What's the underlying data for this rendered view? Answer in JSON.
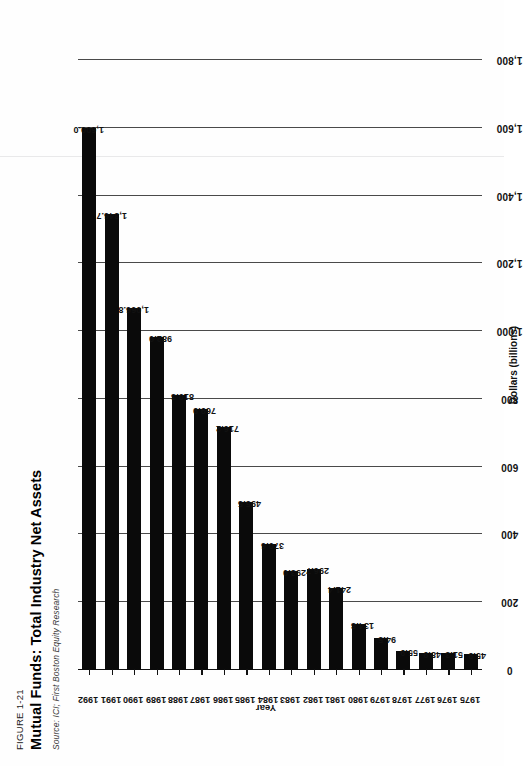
{
  "figure": {
    "number": "FIGURE 1-21",
    "title": "Mutual Funds: Total Industry Net Assets",
    "source": "Source: ICI; First Boston Equity Research"
  },
  "chart_data": {
    "type": "bar",
    "orientation": "horizontal",
    "title": "Mutual Funds: Total Industry Net Assets",
    "xlabel": "Year",
    "ylabel": "Dollars (billions)",
    "ylim": [
      0,
      1800
    ],
    "grid": true,
    "legend": "none",
    "categories": [
      "1975",
      "1976",
      "1977",
      "1978",
      "1979",
      "1980",
      "1981",
      "1982",
      "1983",
      "1984",
      "1985",
      "1986",
      "1987",
      "1988",
      "1989",
      "1990",
      "1991",
      "1992"
    ],
    "values": [
      45.9,
      51.3,
      48.9,
      55.9,
      94.5,
      134.8,
      241.4,
      296.7,
      293.0,
      370.6,
      495.5,
      716.2,
      769.9,
      810.3,
      982.0,
      1066.8,
      1346.7,
      1600.0
    ],
    "data_labels": [
      "45.9",
      "51.3",
      "48.9",
      "55.9",
      "94.5",
      "134.8",
      "241.4",
      "296.7",
      "293.0",
      "370.6",
      "495.5",
      "716.2",
      "769.9",
      "810.3",
      "982.0",
      "1,066.8",
      "1,346.7",
      "1,600.0"
    ],
    "value_ticks": [
      0,
      200,
      400,
      600,
      800,
      1000,
      1200,
      1400,
      1600,
      1800
    ],
    "value_tick_labels": [
      "0",
      "200",
      "400",
      "600",
      "800",
      "1,000",
      "1,200",
      "1,400",
      "1,600",
      "1,800"
    ]
  }
}
